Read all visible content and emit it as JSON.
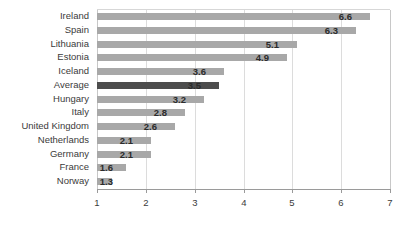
{
  "chart_data": {
    "type": "bar",
    "orientation": "horizontal",
    "title": "",
    "xlabel": "",
    "ylabel": "",
    "xlim": [
      1,
      7
    ],
    "xticks": [
      1,
      2,
      3,
      4,
      5,
      6,
      7
    ],
    "grid": true,
    "legend": "none",
    "highlight_category": "Average",
    "colors": {
      "bar": "#a8a8a8",
      "bar_highlight": "#4d4d4d",
      "gridline": "#dcdcdc",
      "axis": "#9a9a9a",
      "text": "#3b3b3b",
      "value_text": "#2b2b2b",
      "background": "#ffffff"
    },
    "categories": [
      "Ireland",
      "Spain",
      "Lithuania",
      "Estonia",
      "Iceland",
      "Average",
      "Hungary",
      "Italy",
      "United Kingdom",
      "Netherlands",
      "Germany",
      "France",
      "Norway"
    ],
    "values": [
      6.6,
      6.3,
      5.1,
      4.9,
      3.6,
      3.5,
      3.2,
      2.8,
      2.6,
      2.1,
      2.1,
      1.6,
      1.3
    ],
    "value_labels": [
      "6.6",
      "6.3",
      "5.1",
      "4.9",
      "3.6",
      "3.5",
      "3.2",
      "2.8",
      "2.6",
      "2.1",
      "2.1",
      "1.6",
      "1.3"
    ],
    "xtick_labels": [
      "1",
      "2",
      "3",
      "4",
      "5",
      "6",
      "7"
    ]
  }
}
